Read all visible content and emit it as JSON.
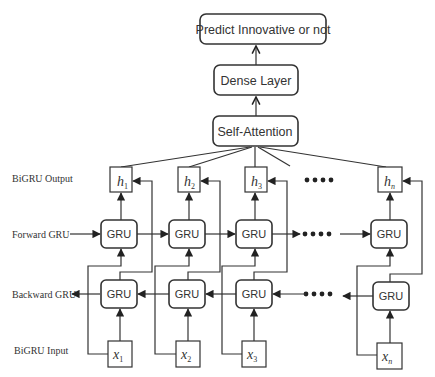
{
  "top_layers": {
    "prediction": "Predict Innovative or not",
    "dense": "Dense Layer",
    "attention": "Self-Attention"
  },
  "row_labels": {
    "output": "BiGRU Output",
    "forward": "Forward GRU",
    "backward": "Backward GRU",
    "input": "BiGRU Input"
  },
  "cells": {
    "gru_label": "GRU",
    "outputs": [
      {
        "var": "h",
        "sub": "1"
      },
      {
        "var": "h",
        "sub": "2"
      },
      {
        "var": "h",
        "sub": "3"
      },
      {
        "var": "h",
        "sub": "n"
      }
    ],
    "inputs": [
      {
        "var": "x",
        "sub": "1"
      },
      {
        "var": "x",
        "sub": "2"
      },
      {
        "var": "x",
        "sub": "3"
      },
      {
        "var": "x",
        "sub": "n"
      }
    ]
  },
  "ellipsis": "••••"
}
